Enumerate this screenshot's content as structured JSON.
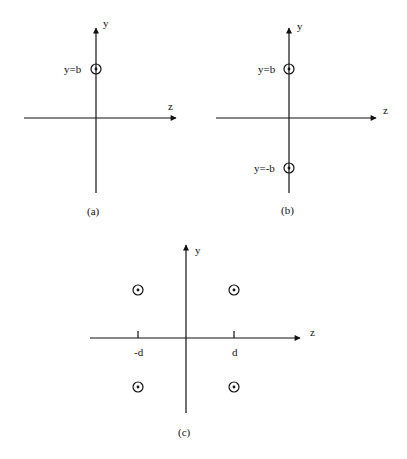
{
  "panels": [
    {
      "id": "a",
      "caption": "(a)",
      "y_axis_label": "y",
      "z_axis_label": "z",
      "points": [
        {
          "label": "y=b",
          "symbol": "out-of-page"
        }
      ]
    },
    {
      "id": "b",
      "caption": "(b)",
      "y_axis_label": "y",
      "z_axis_label": "z",
      "points": [
        {
          "label": "y=b",
          "symbol": "out-of-page"
        },
        {
          "label": "y=-b",
          "symbol": "out-of-page"
        }
      ]
    },
    {
      "id": "c",
      "caption": "(c)",
      "y_axis_label": "y",
      "z_axis_label": "z",
      "tick_labels": [
        "-d",
        "d"
      ],
      "points": [
        {
          "position": "upper-left",
          "symbol": "out-of-page"
        },
        {
          "position": "upper-right",
          "symbol": "out-of-page"
        },
        {
          "position": "lower-left",
          "symbol": "out-of-page"
        },
        {
          "position": "lower-right",
          "symbol": "out-of-page"
        }
      ]
    }
  ],
  "colors": {
    "line": "#111111",
    "background": "#ffffff"
  }
}
